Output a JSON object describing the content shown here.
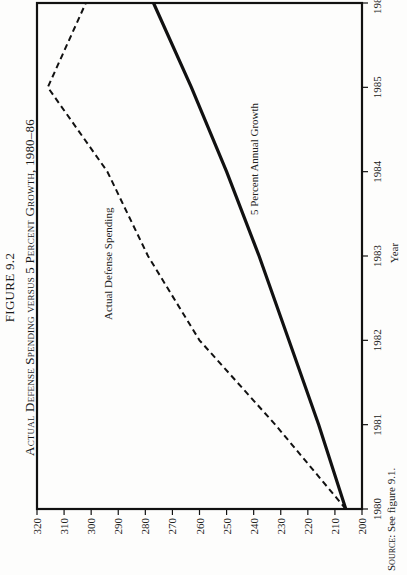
{
  "figure": {
    "number": "FIGURE 9.2",
    "title": "Actual Defense Spending versus 5 Percent Growth, 1980–86"
  },
  "source": {
    "label": "Source:",
    "text": "See figure 9.1."
  },
  "chart_data": {
    "type": "line",
    "title": "Actual Defense Spending versus 5 Percent Growth, 1980–86",
    "xlabel": "Year",
    "ylabel": "Billions of Fiscal 1988 Dollars",
    "x": [
      1980,
      1981,
      1982,
      1983,
      1984,
      1985,
      1986
    ],
    "x_tick_labels": [
      "1980",
      "1981",
      "1982",
      "1983",
      "1984",
      "1985",
      "1986"
    ],
    "y_ticks": [
      200,
      210,
      220,
      230,
      240,
      250,
      260,
      270,
      280,
      290,
      300,
      310,
      320
    ],
    "ylim": [
      200,
      320
    ],
    "xlim": [
      1980,
      1986
    ],
    "grid": false,
    "legend": "inline labels",
    "series": [
      {
        "name": "Actual Defense Spending",
        "style": "dashed",
        "values": [
          206,
          232,
          260,
          279,
          294,
          316,
          302
        ]
      },
      {
        "name": "5 Percent Annual Growth",
        "style": "solid",
        "values": [
          206,
          216,
          227,
          238,
          250,
          263,
          277
        ]
      }
    ]
  }
}
